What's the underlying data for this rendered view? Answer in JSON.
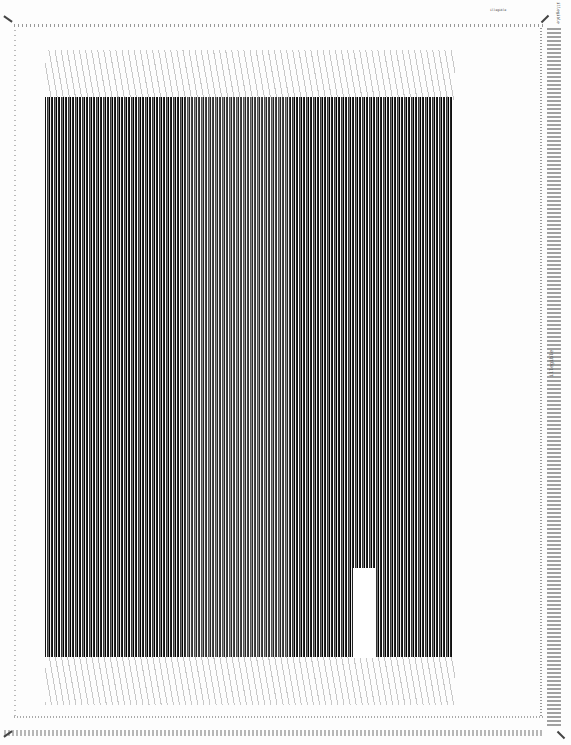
{
  "document": {
    "type": "wire-wrap backplane drawing (scanned)",
    "title_block_text": "illegible",
    "sheet_number_text": "illegible",
    "side_label_text": "illegible"
  },
  "layout": {
    "wire_field_blocks": [
      {
        "name": "left-block",
        "x": 45,
        "y": 97,
        "w": 140,
        "h": 560
      },
      {
        "name": "center-block",
        "x": 185,
        "y": 97,
        "w": 105,
        "h": 560
      },
      {
        "name": "right-block",
        "x": 290,
        "y": 97,
        "w": 163,
        "h": 560
      }
    ],
    "empty_region": {
      "x": 353,
      "y": 568,
      "w": 22,
      "h": 90
    }
  },
  "colors": {
    "ink": "#111111",
    "paper": "#fdfdfd",
    "border": "#999999"
  }
}
